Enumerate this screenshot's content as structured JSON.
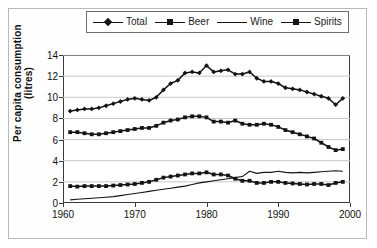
{
  "chart_data": {
    "type": "line",
    "title": "",
    "xlabel": "",
    "ylabel": "Per capita consumption (litres)",
    "xlim": [
      1960,
      2000
    ],
    "ylim": [
      0,
      14
    ],
    "ytick_labels": [
      "0",
      "2",
      "4",
      "6",
      "8",
      "10",
      "12",
      "14"
    ],
    "yticks": [
      0,
      2,
      4,
      6,
      8,
      10,
      12,
      14
    ],
    "xtick_labels": [
      "1960",
      "1970",
      "1980",
      "1990",
      "2000"
    ],
    "xticks": [
      1960,
      1970,
      1980,
      1990,
      2000
    ],
    "grid": "horizontal",
    "legend_position": "top-center",
    "x": [
      1961,
      1962,
      1963,
      1964,
      1965,
      1966,
      1967,
      1968,
      1969,
      1970,
      1971,
      1972,
      1973,
      1974,
      1975,
      1976,
      1977,
      1978,
      1979,
      1980,
      1981,
      1982,
      1983,
      1984,
      1985,
      1986,
      1987,
      1988,
      1989,
      1990,
      1991,
      1992,
      1993,
      1994,
      1995,
      1996,
      1997,
      1998,
      1999
    ],
    "series": [
      {
        "name": "Total",
        "marker": "diamond",
        "values": [
          8.7,
          8.8,
          8.9,
          8.9,
          9.0,
          9.2,
          9.4,
          9.6,
          9.8,
          9.9,
          9.8,
          9.7,
          10.0,
          10.7,
          11.3,
          11.6,
          12.3,
          12.4,
          12.3,
          13.0,
          12.4,
          12.5,
          12.6,
          12.2,
          12.2,
          12.4,
          11.8,
          11.5,
          11.5,
          11.3,
          10.9,
          10.8,
          10.7,
          10.5,
          10.3,
          10.1,
          9.9,
          9.3,
          9.9
        ]
      },
      {
        "name": "Beer",
        "marker": "square",
        "values": [
          6.7,
          6.7,
          6.6,
          6.5,
          6.5,
          6.6,
          6.7,
          6.8,
          6.9,
          7.0,
          7.1,
          7.1,
          7.3,
          7.6,
          7.8,
          7.9,
          8.1,
          8.2,
          8.2,
          8.1,
          7.7,
          7.7,
          7.6,
          7.8,
          7.5,
          7.4,
          7.4,
          7.5,
          7.4,
          7.2,
          6.9,
          6.7,
          6.5,
          6.3,
          6.1,
          5.7,
          5.3,
          5.0,
          5.1
        ]
      },
      {
        "name": "Wine",
        "marker": "none",
        "values": [
          0.3,
          0.35,
          0.4,
          0.45,
          0.5,
          0.55,
          0.6,
          0.7,
          0.8,
          0.9,
          1.0,
          1.1,
          1.2,
          1.3,
          1.4,
          1.5,
          1.6,
          1.75,
          1.9,
          2.0,
          2.1,
          2.2,
          2.3,
          2.4,
          2.5,
          3.0,
          2.8,
          2.9,
          2.9,
          3.0,
          2.9,
          2.85,
          2.9,
          2.85,
          2.9,
          2.95,
          3.0,
          3.05,
          3.0
        ]
      },
      {
        "name": "Spirits",
        "marker": "square",
        "values": [
          1.6,
          1.55,
          1.6,
          1.6,
          1.6,
          1.6,
          1.65,
          1.7,
          1.75,
          1.8,
          1.9,
          2.0,
          2.2,
          2.4,
          2.5,
          2.6,
          2.7,
          2.8,
          2.8,
          2.9,
          2.7,
          2.7,
          2.6,
          2.3,
          2.1,
          2.1,
          1.9,
          1.9,
          2.0,
          2.0,
          1.9,
          1.85,
          1.8,
          1.75,
          1.8,
          1.8,
          1.7,
          1.9,
          2.0
        ]
      }
    ]
  },
  "legend": {
    "items": [
      {
        "label": "Total",
        "marker": "diamond"
      },
      {
        "label": "Beer",
        "marker": "square"
      },
      {
        "label": "Wine",
        "marker": "none"
      },
      {
        "label": "Spirits",
        "marker": "square"
      }
    ]
  },
  "colors": {
    "series": "#141414",
    "axis": "#3a3a3a",
    "grid": "#c7c7c7",
    "frame": "#b9b9b9",
    "plot_background": "#ffffff"
  }
}
